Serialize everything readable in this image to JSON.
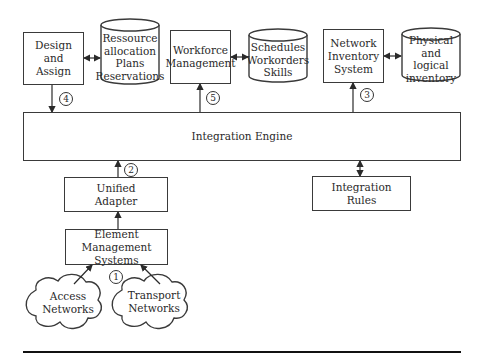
{
  "diagram": {
    "nodes": {
      "design_assign": {
        "label": "Design\nand\nAssign",
        "shape": "rect"
      },
      "resource_db": {
        "label": "Ressource\nallocation\nPlans\nReservations",
        "shape": "cylinder"
      },
      "workforce": {
        "label": "Workforce\nManagement",
        "shape": "rect"
      },
      "schedules_db": {
        "label": "Schedules\nWorkorders\nSkills",
        "shape": "cylinder"
      },
      "network_inventory": {
        "label": "Network\nInventory\nSystem",
        "shape": "rect"
      },
      "inventory_db": {
        "label": "Physical\nand logical\ninventory",
        "shape": "cylinder"
      },
      "integration_engine": {
        "label": "Integration Engine",
        "shape": "rect"
      },
      "unified_adapter": {
        "label": "Unified\nAdapter",
        "shape": "rect"
      },
      "integration_rules": {
        "label": "Integration\nRules",
        "shape": "rect"
      },
      "ems": {
        "label": "Element Management\nSystems",
        "shape": "rect"
      },
      "access_networks": {
        "label": "Access\nNetworks",
        "shape": "cloud"
      },
      "transport_networks": {
        "label": "Transport\nNetworks",
        "shape": "cloud"
      }
    },
    "step_markers": [
      "1",
      "2",
      "3",
      "4",
      "5"
    ],
    "edges": [
      {
        "from": "design_assign",
        "to": "resource_db",
        "type": "bidirectional"
      },
      {
        "from": "workforce",
        "to": "schedules_db",
        "type": "bidirectional"
      },
      {
        "from": "network_inventory",
        "to": "inventory_db",
        "type": "bidirectional"
      },
      {
        "from": "design_assign",
        "to": "integration_engine",
        "step": "4"
      },
      {
        "from": "integration_engine",
        "to": "workforce",
        "step": "5"
      },
      {
        "from": "integration_engine",
        "to": "network_inventory",
        "step": "3"
      },
      {
        "from": "unified_adapter",
        "to": "integration_engine",
        "step": "2"
      },
      {
        "from": "integration_engine",
        "to": "integration_rules",
        "type": "bidirectional"
      },
      {
        "from": "ems",
        "to": "unified_adapter"
      },
      {
        "from": "access_networks",
        "to": "ems",
        "step": "1"
      },
      {
        "from": "transport_networks",
        "to": "ems",
        "step": "1"
      }
    ]
  }
}
